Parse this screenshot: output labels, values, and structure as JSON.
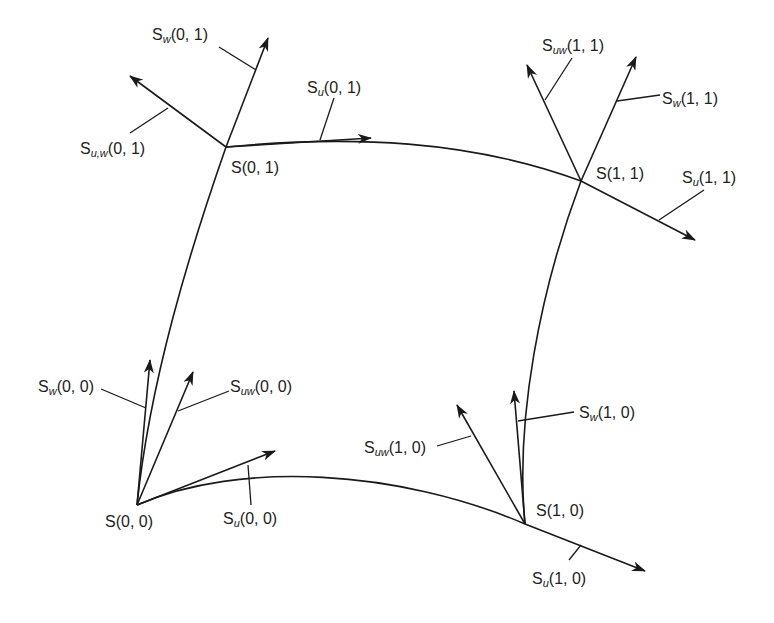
{
  "corners": [
    {
      "id": "s00",
      "label": "S(0, 0)"
    },
    {
      "id": "s10",
      "label": "S(1, 0)"
    },
    {
      "id": "s01",
      "label": "S(0, 1)"
    },
    {
      "id": "s11",
      "label": "S(1, 1)"
    }
  ],
  "labels": {
    "s00": "S(0, 0)",
    "s10": "S(1, 0)",
    "s01": "S(0, 1)",
    "s11": "S(1, 1)",
    "su00_base": "S",
    "su00_sub": "u",
    "su00_arg": "(0, 0)",
    "sw00_base": "S",
    "sw00_sub": "w",
    "sw00_arg": "(0, 0)",
    "suw00_base": "S",
    "suw00_sub": "uw",
    "suw00_arg": "(0, 0)",
    "su10_base": "S",
    "su10_sub": "u",
    "su10_arg": "(1, 0)",
    "sw10_base": "S",
    "sw10_sub": "w",
    "sw10_arg": "(1, 0)",
    "suw10_base": "S",
    "suw10_sub": "uw",
    "suw10_arg": "(1, 0)",
    "su01_base": "S",
    "su01_sub": "u",
    "su01_arg": "(0, 1)",
    "sw01_base": "S",
    "sw01_sub": "w",
    "sw01_arg": "(0, 1)",
    "suw01_base": "S",
    "suw01_sub": "u,w",
    "suw01_arg": "(0, 1)",
    "su11_base": "S",
    "su11_sub": "u",
    "su11_arg": "(1, 1)",
    "sw11_base": "S",
    "sw11_sub": "w",
    "sw11_arg": "(1, 1)",
    "suw11_base": "S",
    "suw11_sub": "uw",
    "suw11_arg": "(1, 1)"
  },
  "colors": {
    "stroke": "#1a1a1a",
    "text": "#222222",
    "background": "#ffffff"
  }
}
